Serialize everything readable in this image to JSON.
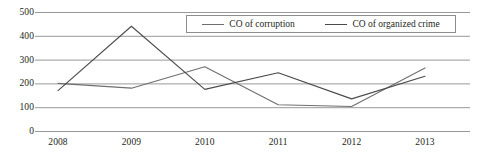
{
  "chart_data": {
    "type": "line",
    "title": "",
    "xlabel": "",
    "ylabel": "",
    "categories": [
      "2008",
      "2009",
      "2010",
      "2011",
      "2012",
      "2013"
    ],
    "x": [
      2008,
      2009,
      2010,
      2011,
      2012,
      2013
    ],
    "series": [
      {
        "name": "CO of corruption",
        "color": "#6f6f6f",
        "values": [
          200,
          180,
          270,
          110,
          103,
          265
        ]
      },
      {
        "name": "CO of organized crime",
        "color": "#4a4a4a",
        "values": [
          170,
          440,
          175,
          245,
          135,
          230
        ]
      }
    ],
    "ylim": [
      0,
      500
    ],
    "xlim": [
      2008,
      2013
    ],
    "ytick_labels": [
      "0",
      "100",
      "200",
      "300",
      "400",
      "500"
    ],
    "ytick_values": [
      0,
      100,
      200,
      300,
      400,
      500
    ],
    "grid": true,
    "grid_color": "#8d8d8d",
    "legend_position": "top-right",
    "legend_entries": [
      "CO of corruption",
      "CO of organized crime"
    ]
  },
  "axes": {
    "y_ticks": [
      {
        "label": "500",
        "value": 500
      },
      {
        "label": "400",
        "value": 400
      },
      {
        "label": "300",
        "value": 300
      },
      {
        "label": "200",
        "value": 200
      },
      {
        "label": "100",
        "value": 100
      },
      {
        "label": "0",
        "value": 0
      }
    ],
    "x_ticks": [
      {
        "label": "2008"
      },
      {
        "label": "2009"
      },
      {
        "label": "2010"
      },
      {
        "label": "2011"
      },
      {
        "label": "2012"
      },
      {
        "label": "2013"
      }
    ]
  },
  "legend": {
    "items": [
      {
        "label": "CO of corruption",
        "color": "#6f6f6f"
      },
      {
        "label": "CO of organized crime",
        "color": "#4a4a4a"
      }
    ]
  }
}
